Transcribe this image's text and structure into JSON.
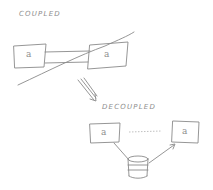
{
  "diagram": {
    "title_coupled": "COUPLED",
    "title_decoupled": "DECOUPLED",
    "coupled": {
      "service_a_label": "a",
      "service_b_label": "a",
      "link": "direct-connection",
      "crossed_out": true
    },
    "transition_arrow": "double-line-arrow-down-right",
    "decoupled": {
      "service_a_label": "a",
      "service_b_label": "a",
      "shared_store": "database-icon",
      "dotted_link": "indirect"
    },
    "colors": {
      "ink": "#8a8a8a",
      "background": "#ffffff"
    }
  }
}
